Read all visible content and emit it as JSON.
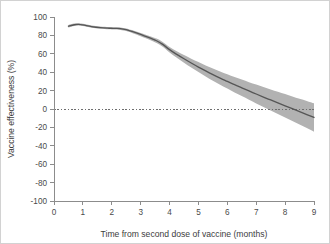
{
  "figure": {
    "background_color": "#ffffff",
    "border_color": "#d2d2d2"
  },
  "chart_data": {
    "type": "line",
    "title": "",
    "subtitle": "",
    "xlabel": "Time from second dose of vaccine (months)",
    "ylabel": "Vaccine effectiveness (%)",
    "xlim": [
      0,
      9
    ],
    "ylim": [
      -100,
      100
    ],
    "xticks": [
      0,
      1,
      2,
      3,
      4,
      5,
      6,
      7,
      8,
      9
    ],
    "xticklabels": [
      "0",
      "1",
      "2",
      "3",
      "4",
      "5",
      "6",
      "7",
      "8",
      "9"
    ],
    "yticks": [
      -100,
      -80,
      -60,
      -40,
      -20,
      0,
      20,
      40,
      60,
      80,
      100
    ],
    "yticklabels": [
      "-100",
      "-80",
      "-60",
      "-40",
      "-20",
      "0",
      "20",
      "40",
      "60",
      "80",
      "100"
    ],
    "grid": false,
    "legend": "none",
    "reference_lines": [
      {
        "name": "zero-effectiveness-line",
        "orientation": "horizontal",
        "value": 0,
        "style": "dotted",
        "color": "#6e6e6e"
      }
    ],
    "line_color": "#565656",
    "band_color": "#b2b2b2",
    "x": [
      0.5,
      0.7,
      0.85,
      1.0,
      1.3,
      1.6,
      1.9,
      2.1,
      2.3,
      2.5,
      2.7,
      3.0,
      3.2,
      3.4,
      3.55,
      3.75,
      4.0,
      4.25,
      4.5,
      4.75,
      5.0,
      5.25,
      5.5,
      5.75,
      6.0,
      6.25,
      6.5,
      6.75,
      7.0,
      7.25,
      7.5,
      7.75,
      8.0,
      8.25,
      8.5,
      8.75,
      9.0
    ],
    "series": [
      {
        "name": "Vaccine effectiveness",
        "values": [
          90.0,
          91.6,
          92.0,
          91.4,
          89.6,
          88.4,
          87.8,
          87.6,
          87.4,
          86.2,
          84.3,
          81.0,
          78.6,
          76.2,
          74.2,
          70.5,
          64.5,
          59.4,
          54.6,
          50.0,
          45.6,
          41.4,
          37.4,
          33.6,
          30.0,
          26.4,
          23.0,
          19.6,
          16.3,
          13.0,
          9.8,
          6.6,
          3.4,
          0.3,
          -2.8,
          -6.0,
          -9.2
        ]
      }
    ],
    "band_lower": [
      88.4,
      90.2,
      90.7,
      90.1,
      88.4,
      87.2,
      86.6,
      86.3,
      86.0,
      84.7,
      82.7,
      79.2,
      76.6,
      74.0,
      71.8,
      67.8,
      61.4,
      55.8,
      50.4,
      45.2,
      40.2,
      35.4,
      30.8,
      26.4,
      22.2,
      18.0,
      14.0,
      10.0,
      6.1,
      2.2,
      -1.6,
      -5.5,
      -9.3,
      -13.1,
      -16.9,
      -20.7,
      -24.6
    ],
    "band_upper": [
      91.4,
      92.8,
      93.2,
      92.6,
      90.8,
      89.6,
      89.0,
      88.8,
      88.7,
      87.6,
      85.8,
      82.7,
      80.5,
      78.3,
      76.5,
      73.1,
      67.5,
      62.9,
      58.7,
      54.7,
      51.0,
      47.4,
      44.0,
      40.8,
      37.8,
      34.8,
      32.0,
      29.2,
      26.5,
      23.8,
      21.2,
      18.7,
      16.2,
      13.7,
      11.2,
      8.8,
      6.2
    ]
  }
}
